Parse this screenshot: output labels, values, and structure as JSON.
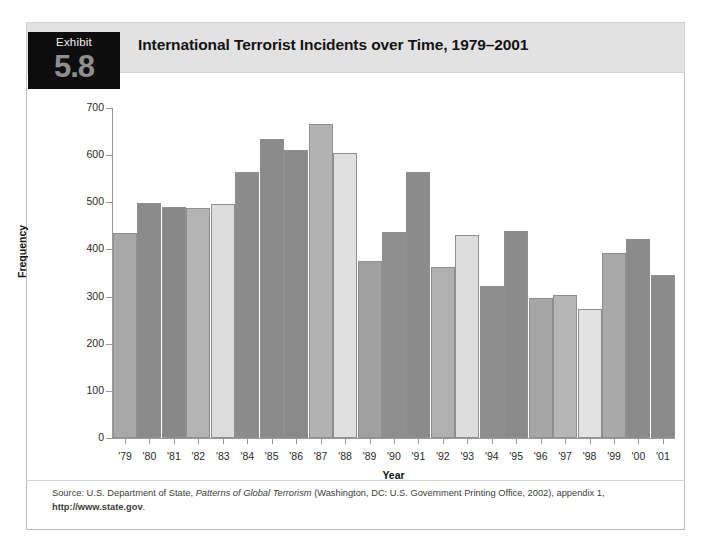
{
  "exhibit": {
    "label": "Exhibit",
    "number": "5.8",
    "title": "International Terrorist Incidents over Time, 1979–2001"
  },
  "source_note": {
    "prefix": "Source: U.S. Department of State, ",
    "italic": "Patterns of Global Terrorism",
    "middle": " (Washington, DC: U.S. Government Printing Office, 2002), appendix 1, ",
    "url": "http://www.state.gov",
    "suffix": "."
  },
  "chart_data": {
    "type": "bar",
    "title": "International Terrorist Incidents over Time, 1979–2001",
    "xlabel": "Year",
    "ylabel": "Frequency",
    "ylim": [
      0,
      700
    ],
    "yticks": [
      0,
      100,
      200,
      300,
      400,
      500,
      600,
      700
    ],
    "grid": false,
    "legend": "none",
    "categories": [
      "'79",
      "'80",
      "'81",
      "'82",
      "'83",
      "'84",
      "'85",
      "'86",
      "'87",
      "'88",
      "'89",
      "'90",
      "'91",
      "'92",
      "'93",
      "'94",
      "'95",
      "'96",
      "'97",
      "'98",
      "'99",
      "'00",
      "'01"
    ],
    "values": [
      434,
      499,
      489,
      487,
      497,
      565,
      635,
      612,
      666,
      605,
      375,
      437,
      565,
      363,
      431,
      322,
      440,
      296,
      304,
      274,
      392,
      423,
      346
    ],
    "bar_colors": [
      "#a8a8a8",
      "#8a8a8a",
      "#888888",
      "#b4b4b4",
      "#dcdcdc",
      "#8c8c8c",
      "#8a8a8a",
      "#898989",
      "#b2b2b2",
      "#e0e0e0",
      "#a0a0a0",
      "#8e8e8e",
      "#8b8b8b",
      "#b0b0b0",
      "#dddddd",
      "#8d8d8d",
      "#8a8a8a",
      "#a6a6a6",
      "#b6b6b6",
      "#e2e2e2",
      "#a9a9a9",
      "#8b8b8b",
      "#8a8a8a"
    ]
  },
  "colors": {
    "header_bg": "#e2e2e2",
    "exhibit_bg": "#0d0d0d",
    "exhibit_number": "#8e8e8e",
    "axis": "#9a9a9a",
    "bar_border": "#8f8f8f",
    "frame": "#bdbdbd"
  }
}
